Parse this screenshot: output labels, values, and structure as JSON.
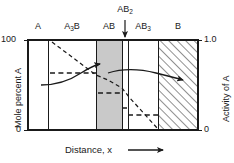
{
  "chart_data": {
    "type": "area",
    "title": "",
    "subtitle": "",
    "xlabel": "Distance, x",
    "ylabel": "Mole percent A",
    "y2label": "Activity of A",
    "xlabel_arrow": "→",
    "ylim": [
      0,
      100
    ],
    "y2lim": [
      0,
      1.0
    ],
    "grid": false,
    "legend": null,
    "x_axis_ticks": [],
    "y_ticks_left": [
      {
        "value": 100,
        "label": "100"
      },
      {
        "value": 0,
        "label": "0"
      }
    ],
    "y_ticks_right": [
      {
        "value": 1.0,
        "label": "1.0"
      },
      {
        "value": 0,
        "label": "0"
      }
    ],
    "phases": [
      {
        "name": "A",
        "label": "A",
        "x_start": 0.0,
        "x_end": 0.118,
        "fill": "none",
        "activity": 1.0,
        "mole_percent": 100
      },
      {
        "name": "A3B",
        "label": "A<sub>3</sub>B",
        "x_start": 0.118,
        "x_end": 0.401,
        "fill": "none",
        "activity": 0.74,
        "mole_percent": 74
      },
      {
        "name": "AB",
        "label": "AB",
        "x_start": 0.401,
        "x_end": 0.553,
        "fill": "gray",
        "activity": 0.47,
        "mole_percent": 47
      },
      {
        "name": "AB2",
        "label": "AB<sub>2</sub>",
        "x_start": 0.553,
        "x_end": 0.588,
        "fill": "none",
        "activity": 0.3,
        "mole_percent": 30
      },
      {
        "name": "AB3",
        "label": "AB<sub>3</sub>",
        "x_start": 0.588,
        "x_end": 0.765,
        "fill": "none",
        "activity": 0.22,
        "mole_percent": 22
      },
      {
        "name": "B",
        "label": "B",
        "x_start": 0.765,
        "x_end": 1.0,
        "fill": "hatched",
        "activity": 0.0,
        "mole_percent": 0
      }
    ],
    "pointer_annotation": {
      "target_phase": "AB2",
      "label": "AB<sub>2</sub>",
      "x": 0.553
    },
    "activity_step_curve": {
      "description": "Dashed step function of activity of A across phase fields",
      "points": [
        {
          "x": 0.118,
          "y": 0.74
        },
        {
          "x": 0.401,
          "y": 0.74
        },
        {
          "x": 0.401,
          "y": 0.47
        },
        {
          "x": 0.553,
          "y": 0.47
        },
        {
          "x": 0.553,
          "y": 0.3
        },
        {
          "x": 0.588,
          "y": 0.3
        },
        {
          "x": 0.588,
          "y": 0.22
        },
        {
          "x": 0.765,
          "y": 0.22
        },
        {
          "x": 0.765,
          "y": 0.0
        }
      ]
    },
    "concentration_profile": {
      "description": "Dashed declining mole percent A profile from 100 at left to 0 at right",
      "points": [
        {
          "x": 0.118,
          "y": 100
        },
        {
          "x": 0.401,
          "y": 70
        },
        {
          "x": 0.553,
          "y": 55
        },
        {
          "x": 0.588,
          "y": 45
        },
        {
          "x": 0.765,
          "y": 0
        }
      ]
    },
    "callout_arrows": [
      {
        "name": "mole-percent-arrow",
        "direction": "left",
        "points_to": "Mole percent A axis"
      },
      {
        "name": "activity-arrow",
        "direction": "right",
        "points_to": "Activity of A axis"
      }
    ],
    "colors": {
      "line": "#1a1a1a",
      "gray_fill": "#c9c9c9",
      "hatch": "#555555",
      "background": "#ffffff",
      "text": "#1a1a1a"
    }
  }
}
